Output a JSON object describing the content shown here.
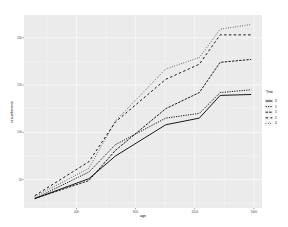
{
  "chart_data": {
    "type": "line",
    "title": "",
    "xlabel": "age",
    "ylabel": "circumference",
    "x": [
      118,
      484,
      664,
      1004,
      1231,
      1372,
      1582
    ],
    "xlim": [
      45,
      1655
    ],
    "ylim": [
      20,
      224
    ],
    "xticks": [
      400,
      800,
      1200,
      1600
    ],
    "xtick_labels": [
      "400",
      "800",
      "1200",
      "1600"
    ],
    "yticks": [
      50,
      100,
      150,
      200
    ],
    "ytick_labels": [
      "50",
      "100",
      "150",
      "200"
    ],
    "grid": true,
    "legend": {
      "title": "Tree",
      "position": "right"
    },
    "series": [
      {
        "name": "3",
        "linetype": "solid",
        "values": [
          30,
          51,
          75,
          108,
          115,
          139,
          140
        ]
      },
      {
        "name": "1",
        "linetype": "22",
        "values": [
          30,
          58,
          87,
          115,
          120,
          142,
          145
        ]
      },
      {
        "name": "5",
        "linetype": "42",
        "values": [
          30,
          49,
          81,
          125,
          142,
          174,
          177
        ]
      },
      {
        "name": "2",
        "linetype": "44",
        "values": [
          33,
          69,
          111,
          156,
          172,
          203,
          203
        ]
      },
      {
        "name": "4",
        "linetype": "13",
        "values": [
          32,
          62,
          112,
          167,
          179,
          209,
          214
        ]
      }
    ],
    "colors": {
      "panel": "#EBEBEB",
      "grid": "#FFFFFF",
      "line": "#000000"
    }
  }
}
